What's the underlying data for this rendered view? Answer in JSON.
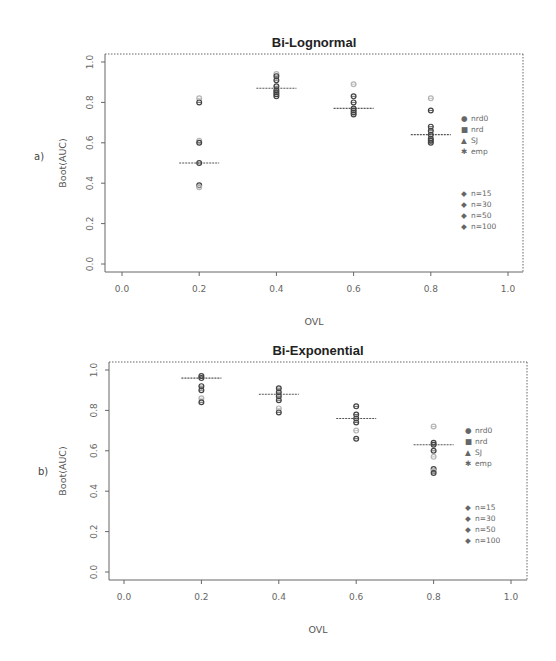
{
  "chart_data": [
    {
      "type": "scatter",
      "panel_label": "a)",
      "title": "Bi-Lognormal",
      "xlabel": "OVL",
      "ylabel": "Boot(AUC)",
      "xlim": [
        0.0,
        1.0
      ],
      "ylim": [
        0.0,
        1.0
      ],
      "xticks": [
        "0.0",
        "0.2",
        "0.4",
        "0.6",
        "0.8",
        "1.0"
      ],
      "yticks": [
        "0.0",
        "0.2",
        "0.4",
        "0.6",
        "0.8",
        "1.0"
      ],
      "grid": false,
      "legend_position": "right",
      "legend_methods": [
        "nrd0",
        "nrd",
        "SJ",
        "emp"
      ],
      "legend_sizes": [
        "n=15",
        "n=30",
        "n=50",
        "n=100"
      ],
      "true_values": [
        {
          "x": 0.2,
          "y": 0.5
        },
        {
          "x": 0.4,
          "y": 0.87
        },
        {
          "x": 0.6,
          "y": 0.77
        },
        {
          "x": 0.8,
          "y": 0.64
        }
      ],
      "points": [
        {
          "x": 0.2,
          "values": [
            0.82,
            0.8,
            0.61,
            0.6,
            0.5,
            0.39,
            0.38
          ]
        },
        {
          "x": 0.4,
          "values": [
            0.94,
            0.93,
            0.91,
            0.88,
            0.86,
            0.85,
            0.84,
            0.83
          ]
        },
        {
          "x": 0.6,
          "values": [
            0.89,
            0.83,
            0.8,
            0.77,
            0.76,
            0.75,
            0.74
          ]
        },
        {
          "x": 0.8,
          "values": [
            0.82,
            0.76,
            0.68,
            0.66,
            0.64,
            0.62,
            0.61,
            0.6
          ]
        }
      ]
    },
    {
      "type": "scatter",
      "panel_label": "b)",
      "title": "Bi-Exponential",
      "xlabel": "OVL",
      "ylabel": "Boot(AUC)",
      "xlim": [
        0.0,
        1.0
      ],
      "ylim": [
        0.0,
        1.0
      ],
      "xticks": [
        "0.0",
        "0.2",
        "0.4",
        "0.6",
        "0.8",
        "1.0"
      ],
      "yticks": [
        "0.0",
        "0.2",
        "0.4",
        "0.6",
        "0.8",
        "1.0"
      ],
      "grid": false,
      "legend_position": "right",
      "legend_methods": [
        "nrd0",
        "nrd",
        "SJ",
        "emp"
      ],
      "legend_sizes": [
        "n=15",
        "n=30",
        "n=50",
        "n=100"
      ],
      "true_values": [
        {
          "x": 0.2,
          "y": 0.96
        },
        {
          "x": 0.4,
          "y": 0.88
        },
        {
          "x": 0.6,
          "y": 0.76
        },
        {
          "x": 0.8,
          "y": 0.63
        }
      ],
      "points": [
        {
          "x": 0.2,
          "values": [
            0.97,
            0.96,
            0.92,
            0.9,
            0.86,
            0.84
          ]
        },
        {
          "x": 0.4,
          "values": [
            0.91,
            0.89,
            0.87,
            0.85,
            0.81,
            0.79
          ]
        },
        {
          "x": 0.6,
          "values": [
            0.82,
            0.78,
            0.76,
            0.74,
            0.7,
            0.66
          ]
        },
        {
          "x": 0.8,
          "values": [
            0.72,
            0.64,
            0.63,
            0.6,
            0.57,
            0.51,
            0.5,
            0.49
          ]
        }
      ]
    }
  ],
  "colors": {
    "dark_point": "#444444",
    "light_point": "#b5b5b5",
    "axis": "#666666",
    "true_line": "#555555"
  }
}
